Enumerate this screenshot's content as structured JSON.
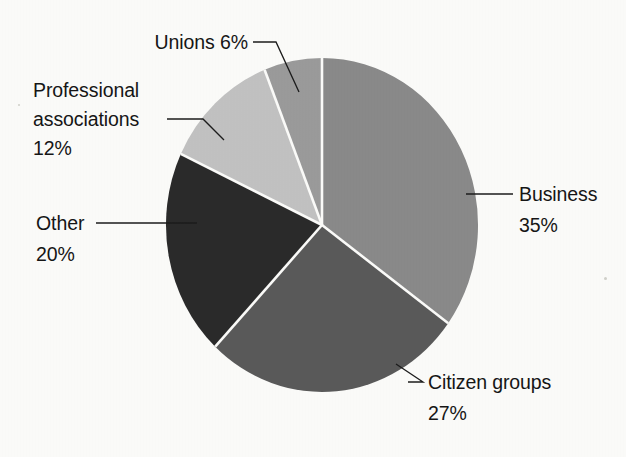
{
  "chart_data": {
    "type": "pie",
    "title": "",
    "subtitle": "",
    "xlabel": "",
    "ylabel": "",
    "grid": false,
    "legend_position": "none",
    "labels_outside": true,
    "value_unit": "%",
    "total": 100,
    "start_angle_deg": 0,
    "direction": "clockwise",
    "categories": [
      "Business",
      "Citizen groups",
      "Other",
      "Professional associations",
      "Unions"
    ],
    "values": [
      35,
      27,
      20,
      12,
      6
    ],
    "slices": [
      {
        "name": "Business",
        "label": "Business",
        "value": 35,
        "value_text": "35%",
        "color": "#8a8a8a",
        "start_deg": 0,
        "end_deg": 126
      },
      {
        "name": "Citizen groups",
        "label": "Citizen groups",
        "value": 27,
        "value_text": "27%",
        "color": "#5a5a5a",
        "start_deg": 126,
        "end_deg": 223.2
      },
      {
        "name": "Other",
        "label": "Other",
        "value": 20,
        "value_text": "20%",
        "color": "#2b2b2b",
        "start_deg": 223.2,
        "end_deg": 295.2
      },
      {
        "name": "Professional associations",
        "label": "Professional associations",
        "label_line1": "Professional",
        "label_line2": "associations",
        "value": 12,
        "value_text": "12%",
        "color": "#c2c2c2",
        "start_deg": 295.2,
        "end_deg": 338.4
      },
      {
        "name": "Unions",
        "label": "Unions",
        "value": 6,
        "value_text": "6%",
        "color": "#9b9b9b",
        "start_deg": 338.4,
        "end_deg": 360
      }
    ],
    "colors": {
      "business": "#8a8a8a",
      "citizen_groups": "#5a5a5a",
      "other": "#2b2b2b",
      "professional_associations": "#c2c2c2",
      "unions": "#9b9b9b",
      "background": "#fcfcfa",
      "separator": "#fcfcfa",
      "text": "#161616",
      "leader_line": "#1d1d1d"
    }
  },
  "annotations": {
    "unions": {
      "text": "Unions  6%",
      "name_part": "Unions",
      "value_part": "6%"
    },
    "professional": {
      "line1": "Professional",
      "line2": "associations",
      "line3": "12%"
    },
    "other": {
      "line1": "Other",
      "line2": "20%"
    },
    "business": {
      "line1": "Business",
      "line2": "35%"
    },
    "citizen": {
      "line1": "Citizen groups",
      "line2": "27%"
    }
  }
}
